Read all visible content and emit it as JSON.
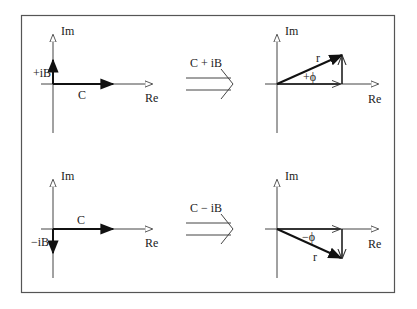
{
  "diagram": {
    "frame": {
      "stroke": "#555555"
    },
    "top_row": {
      "left_plot": {
        "im_label": "Im",
        "re_label": "Re",
        "imag_component_label": "+iB",
        "real_component_label": "C"
      },
      "transform": {
        "label": "C + iB"
      },
      "right_plot": {
        "im_label": "Im",
        "re_label": "Re",
        "magnitude_label": "r",
        "angle_label": "+ϕ"
      }
    },
    "bottom_row": {
      "left_plot": {
        "im_label": "Im",
        "re_label": "Re",
        "imag_component_label": "−iB",
        "real_component_label": "C"
      },
      "transform": {
        "label": "C − iB"
      },
      "right_plot": {
        "im_label": "Im",
        "re_label": "Re",
        "magnitude_label": "r",
        "angle_label": "−ϕ"
      }
    }
  }
}
